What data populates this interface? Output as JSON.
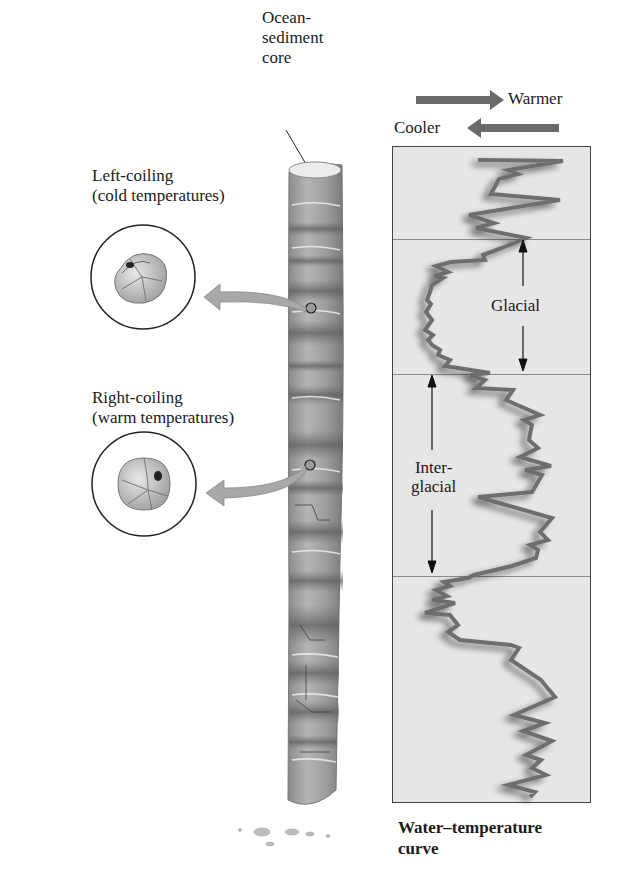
{
  "core": {
    "label_lines": [
      "Ocean-",
      "sediment",
      "core"
    ]
  },
  "legend": {
    "warmer": "Warmer",
    "cooler": "Cooler",
    "arrow_color": "#6a6a6a"
  },
  "foraminifera": {
    "left_coiling": {
      "line1": "Left-coiling",
      "line2": "(cold temperatures)"
    },
    "right_coiling": {
      "line1": "Right-coiling",
      "line2": "(warm temperatures)"
    }
  },
  "chart": {
    "glacial_label": "Glacial",
    "interglacial_line1": "Inter-",
    "interglacial_line2": "glacial",
    "caption_line1": "Water–temperature",
    "caption_line2": "curve"
  },
  "chart_data": {
    "type": "line",
    "title": "Water–temperature curve",
    "xlabel": "Temperature (Cooler ← → Warmer)",
    "ylabel": "Depth in core (time)",
    "orientation": "vertical",
    "regions": [
      {
        "name": "Glacial",
        "y_start": 238,
        "y_end": 373
      },
      {
        "name": "Interglacial",
        "y_start": 373,
        "y_end": 575
      }
    ],
    "points": [
      [
        478,
        160
      ],
      [
        563,
        161
      ],
      [
        508,
        170
      ],
      [
        518,
        174
      ],
      [
        499,
        179
      ],
      [
        491,
        194
      ],
      [
        560,
        200
      ],
      [
        469,
        215
      ],
      [
        494,
        223
      ],
      [
        476,
        228
      ],
      [
        526,
        238
      ],
      [
        502,
        248
      ],
      [
        483,
        255
      ],
      [
        485,
        260
      ],
      [
        451,
        262
      ],
      [
        436,
        266
      ],
      [
        444,
        270
      ],
      [
        448,
        272
      ],
      [
        434,
        276
      ],
      [
        443,
        278
      ],
      [
        432,
        285
      ],
      [
        430,
        292
      ],
      [
        427,
        300
      ],
      [
        431,
        304
      ],
      [
        426,
        312
      ],
      [
        432,
        320
      ],
      [
        425,
        330
      ],
      [
        433,
        335
      ],
      [
        428,
        340
      ],
      [
        432,
        345
      ],
      [
        440,
        350
      ],
      [
        438,
        355
      ],
      [
        450,
        360
      ],
      [
        445,
        366
      ],
      [
        490,
        373
      ],
      [
        470,
        375
      ],
      [
        485,
        380
      ],
      [
        476,
        388
      ],
      [
        513,
        390
      ],
      [
        506,
        400
      ],
      [
        540,
        415
      ],
      [
        524,
        420
      ],
      [
        532,
        425
      ],
      [
        530,
        434
      ],
      [
        529,
        440
      ],
      [
        538,
        448
      ],
      [
        520,
        457
      ],
      [
        551,
        466
      ],
      [
        525,
        470
      ],
      [
        542,
        475
      ],
      [
        532,
        492
      ],
      [
        478,
        497
      ],
      [
        552,
        518
      ],
      [
        540,
        532
      ],
      [
        548,
        540
      ],
      [
        530,
        545
      ],
      [
        538,
        550
      ],
      [
        536,
        558
      ],
      [
        512,
        566
      ],
      [
        474,
        575
      ],
      [
        468,
        578
      ],
      [
        444,
        582
      ],
      [
        450,
        586
      ],
      [
        436,
        590
      ],
      [
        447,
        596
      ],
      [
        432,
        600
      ],
      [
        455,
        603
      ],
      [
        425,
        613
      ],
      [
        450,
        615
      ],
      [
        458,
        625
      ],
      [
        448,
        632
      ],
      [
        460,
        640
      ],
      [
        511,
        645
      ],
      [
        519,
        648
      ],
      [
        511,
        660
      ],
      [
        541,
        680
      ],
      [
        545,
        685
      ],
      [
        555,
        697
      ],
      [
        514,
        715
      ],
      [
        545,
        723
      ],
      [
        523,
        731
      ],
      [
        552,
        741
      ],
      [
        526,
        755
      ],
      [
        541,
        760
      ],
      [
        532,
        768
      ],
      [
        546,
        775
      ],
      [
        508,
        785
      ],
      [
        535,
        792
      ],
      [
        530,
        797
      ]
    ]
  }
}
